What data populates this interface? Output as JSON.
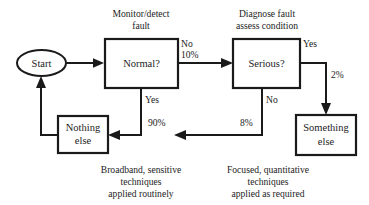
{
  "diagram": {
    "colors": {
      "stroke": "#1a1a1a",
      "fill": "#ffffff",
      "text": "#1c1c1c",
      "background": "#ffffff"
    },
    "nodes": {
      "start": {
        "label": "Start",
        "shape": "ellipse"
      },
      "normal": {
        "label": "Normal?",
        "shape": "rectangle"
      },
      "serious": {
        "label": "Serious?",
        "shape": "rectangle"
      },
      "nothing_else": {
        "line1": "Nothing",
        "line2": "else",
        "shape": "rectangle"
      },
      "something_else": {
        "line1": "Something",
        "line2": "else",
        "shape": "rectangle"
      }
    },
    "headings": {
      "monitor": {
        "line1": "Monitor/detect",
        "line2": "fault"
      },
      "diagnose": {
        "line1": "Diagnose fault",
        "line2": "assess condition"
      }
    },
    "edge_labels": {
      "normal_no": "No",
      "normal_no_pct": "10%",
      "normal_yes": "Yes",
      "normal_yes_pct": "90%",
      "serious_yes": "Yes",
      "serious_yes_pct": "2%",
      "serious_no": "No",
      "serious_no_pct": "8%"
    },
    "captions": {
      "left": {
        "line1": "Broadband, sensitive",
        "line2": "techniques",
        "line3": "applied routinely"
      },
      "right": {
        "line1": "Focused, quantitative",
        "line2": "techniques",
        "line3": "applied as required"
      }
    }
  }
}
